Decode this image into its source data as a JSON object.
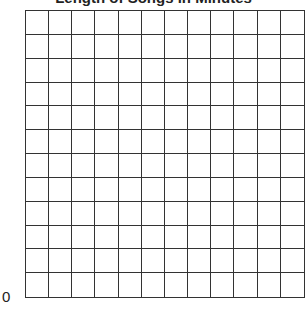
{
  "chart_data": {
    "type": "bar",
    "title": "Length of Songs in Minutes",
    "xlabel": "",
    "ylabel": "",
    "categories": [],
    "values": [],
    "y_tick_labels": [
      "0"
    ],
    "grid": {
      "on": true,
      "rows": 12,
      "columns": 12,
      "line_color": "#333333"
    },
    "legend": null
  },
  "labels": {
    "title": "Length of Songs in Minutes",
    "origin": "0"
  }
}
